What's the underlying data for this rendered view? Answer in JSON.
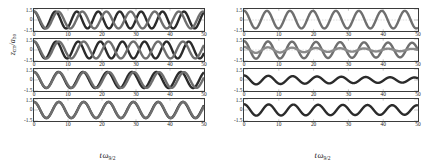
{
  "figure": {
    "axis": {
      "xlabel_main": "t",
      "xlabel_omega": "ω",
      "xlabel_sub": "9/2",
      "ylabel_z": "z",
      "ylabel_cm": "cm",
      "ylabel_slash": "/a",
      "ylabel_ho": "ho"
    },
    "xticks": [
      "0",
      "10",
      "20",
      "30",
      "40",
      "50"
    ],
    "xtick_values": [
      0,
      10,
      20,
      30,
      40,
      50
    ],
    "yticks": [
      "1.5",
      "0",
      "-1.5"
    ],
    "ytick_values": [
      1.5,
      0,
      -1.5
    ],
    "colors": {
      "axis": "#3b3b3b",
      "curve_primary": "#2b2b2b",
      "curve_secondary": "#6f6f6f",
      "dashed_reference": "#8a8a8a"
    }
  },
  "chart_data": {
    "type": "line",
    "title": "",
    "xlabel": "t ω_9/2",
    "ylabel": "z_cm / a_ho",
    "xlim": [
      0,
      50
    ],
    "ylim": [
      -1.5,
      1.5
    ],
    "grid": false,
    "legend": "none",
    "panel_rows": 4,
    "panel_cols": 2,
    "panels": [
      {
        "id": "left-1",
        "column": "left",
        "row": 1,
        "has_dashed_reference": false,
        "series": [
          {
            "name": "curve-a",
            "kind": "cosine",
            "amplitude": 1.15,
            "period": 6.3,
            "phase": 0.0,
            "decay": 0.0,
            "offset": 0.0,
            "color": "#2b2b2b"
          },
          {
            "name": "curve-b",
            "kind": "cosine",
            "amplitude": 1.15,
            "period": 7.1,
            "phase": 0.0,
            "decay": 0.0,
            "offset": 0.0,
            "color": "#6f6f6f"
          }
        ]
      },
      {
        "id": "left-2",
        "column": "left",
        "row": 2,
        "has_dashed_reference": false,
        "series": [
          {
            "name": "curve-a",
            "kind": "cosine",
            "amplitude": 1.15,
            "period": 6.5,
            "phase": 0.0,
            "decay": 0.0,
            "offset": 0.0,
            "color": "#2b2b2b"
          },
          {
            "name": "curve-b",
            "kind": "cosine",
            "amplitude": 1.15,
            "period": 7.3,
            "phase": 0.0,
            "decay": 0.0,
            "offset": 0.0,
            "color": "#6f6f6f"
          }
        ]
      },
      {
        "id": "left-3",
        "column": "left",
        "row": 3,
        "has_dashed_reference": false,
        "series": [
          {
            "name": "curve-a",
            "kind": "cosine",
            "amplitude": 1.1,
            "period": 7.2,
            "phase": 0.0,
            "decay": 0.0,
            "offset": 0.0,
            "color": "#2b2b2b"
          },
          {
            "name": "curve-b",
            "kind": "cosine",
            "amplitude": 1.08,
            "period": 7.35,
            "phase": 0.0,
            "decay": 0.0,
            "offset": 0.0,
            "color": "#6f6f6f"
          }
        ]
      },
      {
        "id": "left-4",
        "column": "left",
        "row": 4,
        "has_dashed_reference": false,
        "series": [
          {
            "name": "curve-a",
            "kind": "cosine",
            "amplitude": 1.1,
            "period": 7.3,
            "phase": 0.0,
            "decay": 0.0,
            "offset": 0.0,
            "color": "#2b2b2b"
          },
          {
            "name": "curve-b",
            "kind": "cosine",
            "amplitude": 1.1,
            "period": 7.32,
            "phase": 0.0,
            "decay": 0.0,
            "offset": 0.0,
            "color": "#6f6f6f"
          }
        ]
      },
      {
        "id": "right-1",
        "column": "right",
        "row": 1,
        "has_dashed_reference": true,
        "reference_value": 0.0,
        "series": [
          {
            "name": "curve-a",
            "kind": "cosine",
            "amplitude": 1.2,
            "period": 6.6,
            "phase": 0.0,
            "decay": 0.0,
            "offset": 0.05,
            "color": "#6f6f6f"
          }
        ]
      },
      {
        "id": "right-2",
        "column": "right",
        "row": 2,
        "has_dashed_reference": true,
        "reference_value": 0.0,
        "series": [
          {
            "name": "curve-a",
            "kind": "cosine",
            "amplitude": 1.2,
            "period": 6.9,
            "phase": 0.0,
            "decay": 0.004,
            "offset": 0.0,
            "color": "#6f6f6f"
          },
          {
            "name": "curve-b",
            "kind": "cosine",
            "amplitude": 0.42,
            "period": 6.9,
            "phase": 0.0,
            "decay": 0.02,
            "offset": 0.0,
            "color": "#8a8a8a"
          }
        ]
      },
      {
        "id": "right-3",
        "column": "right",
        "row": 3,
        "has_dashed_reference": false,
        "series": [
          {
            "name": "curve-a",
            "kind": "cosine",
            "amplitude": 0.62,
            "period": 7.0,
            "phase": 0.0,
            "decay": 0.012,
            "offset": 0.0,
            "color": "#2b2b2b"
          }
        ]
      },
      {
        "id": "right-4",
        "column": "right",
        "row": 4,
        "has_dashed_reference": false,
        "series": [
          {
            "name": "curve-a",
            "kind": "cosine",
            "amplitude": 0.78,
            "period": 7.1,
            "phase": 0.0,
            "decay": 0.004,
            "offset": 0.0,
            "color": "#2b2b2b"
          }
        ]
      }
    ]
  }
}
